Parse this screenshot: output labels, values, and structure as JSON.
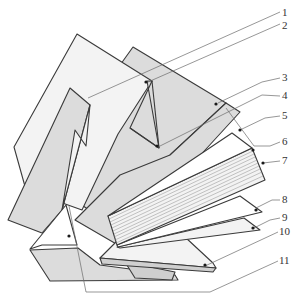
{
  "figure": {
    "type": "exploded-layer-diagram",
    "colors": {
      "outline": "#3a3a3a",
      "light_fill": "#f3f3f3",
      "mid_fill": "#dcdcdc",
      "dark_fill": "#cfcfcf",
      "leader": "#6a6a6a"
    }
  },
  "callouts": [
    {
      "id": 1,
      "label": "1"
    },
    {
      "id": 2,
      "label": "2"
    },
    {
      "id": 3,
      "label": "3"
    },
    {
      "id": 4,
      "label": "4"
    },
    {
      "id": 5,
      "label": "5"
    },
    {
      "id": 6,
      "label": "6"
    },
    {
      "id": 7,
      "label": "7"
    },
    {
      "id": 8,
      "label": "8"
    },
    {
      "id": 9,
      "label": "9"
    },
    {
      "id": 10,
      "label": "10"
    },
    {
      "id": 11,
      "label": "11"
    }
  ]
}
